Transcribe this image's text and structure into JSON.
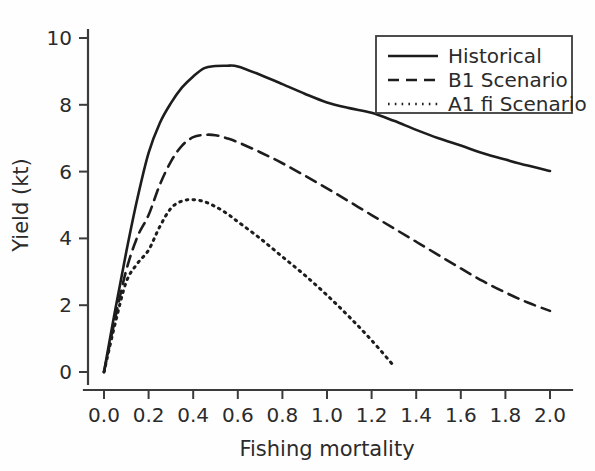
{
  "figure": {
    "background_color": "#fefefe",
    "ink_color": "#1d1d1d"
  },
  "chart_data": {
    "type": "line",
    "title": "",
    "subtitle": "",
    "xlabel": "Fishing mortality",
    "ylabel": "Yield (kt)",
    "xlim": [
      0.0,
      2.05
    ],
    "ylim": [
      0.0,
      10.4
    ],
    "xticks": [
      "0.0",
      "0.2",
      "0.4",
      "0.6",
      "0.8",
      "1.0",
      "1.2",
      "1.4",
      "1.6",
      "1.8",
      "2.0"
    ],
    "xtick_values": [
      0.0,
      0.2,
      0.4,
      0.6,
      0.8,
      1.0,
      1.2,
      1.4,
      1.6,
      1.8,
      2.0
    ],
    "yticks": [
      "0",
      "2",
      "4",
      "6",
      "8",
      "10"
    ],
    "ytick_values": [
      0,
      2,
      4,
      6,
      8,
      10
    ],
    "grid": false,
    "legend_position": "top-right",
    "annotations": [],
    "series": [
      {
        "name": "Historical",
        "style": "solid",
        "color": "#1d1d1d",
        "x": [
          0.0,
          0.05,
          0.1,
          0.15,
          0.2,
          0.25,
          0.3,
          0.35,
          0.4,
          0.45,
          0.5,
          0.55,
          0.6,
          0.7,
          0.8,
          0.9,
          1.0,
          1.1,
          1.2,
          1.3,
          1.4,
          1.5,
          1.6,
          1.7,
          1.8,
          1.9,
          2.0
        ],
        "y": [
          0.0,
          1.85,
          3.6,
          5.2,
          6.56,
          7.45,
          8.05,
          8.52,
          8.85,
          9.1,
          9.16,
          9.17,
          9.15,
          8.9,
          8.62,
          8.33,
          8.07,
          7.9,
          7.76,
          7.52,
          7.25,
          7.0,
          6.78,
          6.55,
          6.36,
          6.18,
          6.02
        ]
      },
      {
        "name": "B1 Scenario",
        "style": "dashed",
        "color": "#1d1d1d",
        "x": [
          0.0,
          0.05,
          0.1,
          0.15,
          0.2,
          0.25,
          0.3,
          0.35,
          0.4,
          0.45,
          0.5,
          0.55,
          0.6,
          0.7,
          0.8,
          0.9,
          1.0,
          1.1,
          1.2,
          1.3,
          1.4,
          1.5,
          1.6,
          1.7,
          1.8,
          1.9,
          2.0
        ],
        "y": [
          0.0,
          1.6,
          3.05,
          4.05,
          4.7,
          5.6,
          6.3,
          6.78,
          7.03,
          7.1,
          7.09,
          7.0,
          6.88,
          6.58,
          6.25,
          5.88,
          5.5,
          5.1,
          4.7,
          4.3,
          3.9,
          3.5,
          3.1,
          2.72,
          2.38,
          2.08,
          1.83
        ]
      },
      {
        "name": "A1 fi Scenario",
        "style": "dotted",
        "color": "#1d1d1d",
        "x": [
          0.0,
          0.05,
          0.1,
          0.15,
          0.2,
          0.25,
          0.3,
          0.35,
          0.4,
          0.45,
          0.5,
          0.55,
          0.6,
          0.7,
          0.8,
          0.9,
          1.0,
          1.1,
          1.2,
          1.3
        ],
        "y": [
          0.0,
          1.45,
          2.7,
          3.25,
          3.65,
          4.35,
          4.9,
          5.12,
          5.16,
          5.1,
          4.95,
          4.75,
          4.5,
          4.0,
          3.45,
          2.9,
          2.3,
          1.65,
          0.95,
          0.18
        ]
      }
    ]
  },
  "legend": {
    "entries": [
      {
        "label": "Historical",
        "style": "solid"
      },
      {
        "label": "B1 Scenario",
        "style": "dashed"
      },
      {
        "label": "A1 fi Scenario",
        "style": "dotted"
      }
    ]
  }
}
